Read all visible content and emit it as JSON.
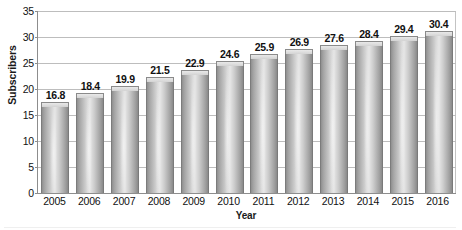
{
  "chart_data": {
    "type": "bar",
    "title": "",
    "xlabel": "Year",
    "ylabel": "Subscribers",
    "categories": [
      "2005",
      "2006",
      "2007",
      "2008",
      "2009",
      "2010",
      "2011",
      "2012",
      "2013",
      "2014",
      "2015",
      "2016"
    ],
    "values": [
      16.8,
      18.4,
      19.9,
      21.5,
      22.9,
      24.6,
      25.9,
      26.9,
      27.6,
      28.4,
      29.4,
      30.4
    ],
    "value_labels": [
      "16.8",
      "18.4",
      "19.9",
      "21.5",
      "22.9",
      "24.6",
      "25.9",
      "26.9",
      "27.6",
      "28.4",
      "29.4",
      "30.4"
    ],
    "ylim": [
      0,
      35
    ],
    "yticks": [
      0,
      5,
      10,
      15,
      20,
      25,
      30,
      35
    ],
    "ytick_labels": [
      "0",
      "5",
      "10",
      "15",
      "20",
      "25",
      "30",
      "35"
    ],
    "grid": true,
    "grid_axis": "y",
    "legend": null,
    "series_color": "#b4b4b4",
    "gridline_color": "#bdbdbd",
    "axis_color": "#8d8d8d",
    "text_color": "#111111"
  }
}
